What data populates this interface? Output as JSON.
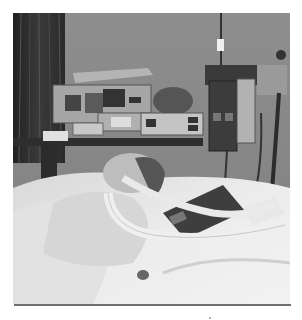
{
  "figure": {
    "alt": "Black-and-white photograph of a patient lying in a hospital bed connected to a ventilator tube, with medical monitoring equipment and IV poles in the background",
    "colors": {
      "wall": "#8c8c8c",
      "curtain": "#2e2e2e",
      "bedding": "#e6e6e6",
      "equipment": "#a8a8a8",
      "dark_panel": "#3a3a3a",
      "rule": "#6e6e6e"
    },
    "elements": {
      "curtain": "window-curtain",
      "monitor_shelf": "medical-monitors",
      "iv_pole": "iv-pole-with-pumps",
      "patient": "patient-in-bed",
      "ventilator_tube": "ventilator-tubing",
      "tablet_device": "ventilator-control-panel"
    }
  }
}
